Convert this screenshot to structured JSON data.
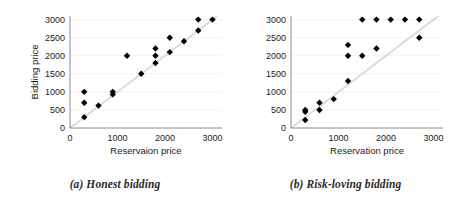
{
  "figure": {
    "panels": [
      {
        "id": "panel-a",
        "caption": "(a) Honest bidding",
        "chart_data": {
          "type": "scatter",
          "title": "",
          "xlabel": "Reservaion price",
          "ylabel": "Bidding price",
          "xlim": [
            0,
            3200
          ],
          "ylim": [
            0,
            3100
          ],
          "xticks": [
            0,
            1000,
            2000,
            3000
          ],
          "xticklabels": [
            "0",
            "1000",
            "2000",
            "3000"
          ],
          "yticks": [
            0,
            500,
            1000,
            1500,
            2000,
            2500,
            3000
          ],
          "yticklabels": [
            "0",
            "500",
            "1000",
            "1500",
            "2000",
            "2500",
            "3000"
          ],
          "grid": true,
          "legend": "none",
          "reference_line": {
            "name": "y = x",
            "from": [
              0,
              0
            ],
            "to": [
              3100,
              3100
            ],
            "color": "#d9d9d9"
          },
          "marker": {
            "shape": "diamond",
            "color": "#000000",
            "size": 3.2
          },
          "points": [
            {
              "x": 300,
              "y": 1000
            },
            {
              "x": 300,
              "y": 700
            },
            {
              "x": 300,
              "y": 300
            },
            {
              "x": 600,
              "y": 620
            },
            {
              "x": 900,
              "y": 1000
            },
            {
              "x": 900,
              "y": 930
            },
            {
              "x": 1200,
              "y": 2000
            },
            {
              "x": 1500,
              "y": 1500
            },
            {
              "x": 1800,
              "y": 2200
            },
            {
              "x": 1800,
              "y": 2000
            },
            {
              "x": 1800,
              "y": 1800
            },
            {
              "x": 2100,
              "y": 2500
            },
            {
              "x": 2100,
              "y": 2100
            },
            {
              "x": 2400,
              "y": 2400
            },
            {
              "x": 2700,
              "y": 3000
            },
            {
              "x": 2700,
              "y": 2700
            },
            {
              "x": 3000,
              "y": 3000
            }
          ]
        }
      },
      {
        "id": "panel-b",
        "caption": "(b) Risk-loving bidding",
        "chart_data": {
          "type": "scatter",
          "title": "",
          "xlabel": "Reservation price",
          "ylabel": "",
          "xlim": [
            0,
            3200
          ],
          "ylim": [
            0,
            3100
          ],
          "xticks": [
            0,
            1000,
            2000,
            3000
          ],
          "xticklabels": [
            "0",
            "1000",
            "2000",
            "3000"
          ],
          "yticks": [
            0,
            500,
            1000,
            1500,
            2000,
            2500,
            3000
          ],
          "yticklabels": [
            "0",
            "500",
            "1000",
            "1500",
            "2000",
            "2500",
            "3000"
          ],
          "grid": true,
          "legend": "none",
          "reference_line": {
            "name": "y = x",
            "from": [
              0,
              0
            ],
            "to": [
              3100,
              3100
            ],
            "color": "#d9d9d9"
          },
          "marker": {
            "shape": "diamond",
            "color": "#000000",
            "size": 3.2
          },
          "points": [
            {
              "x": 300,
              "y": 500
            },
            {
              "x": 300,
              "y": 450
            },
            {
              "x": 300,
              "y": 220
            },
            {
              "x": 600,
              "y": 700
            },
            {
              "x": 600,
              "y": 500
            },
            {
              "x": 900,
              "y": 800
            },
            {
              "x": 1200,
              "y": 2300
            },
            {
              "x": 1200,
              "y": 2000
            },
            {
              "x": 1200,
              "y": 1300
            },
            {
              "x": 1500,
              "y": 3000
            },
            {
              "x": 1500,
              "y": 2000
            },
            {
              "x": 1800,
              "y": 3000
            },
            {
              "x": 1800,
              "y": 2200
            },
            {
              "x": 2100,
              "y": 3000
            },
            {
              "x": 2400,
              "y": 3000
            },
            {
              "x": 2700,
              "y": 3000
            },
            {
              "x": 2700,
              "y": 2500
            }
          ]
        }
      }
    ]
  }
}
